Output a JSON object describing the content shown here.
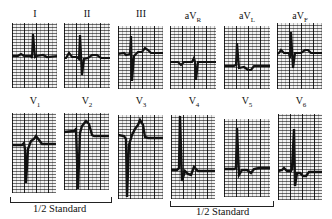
{
  "figure": {
    "type": "12-lead electrocardiogram strips",
    "rows": [
      {
        "leads": [
          {
            "label": "I",
            "sub": ""
          },
          {
            "label": "II",
            "sub": ""
          },
          {
            "label": "III",
            "sub": ""
          },
          {
            "label": "aV",
            "sub": "R"
          },
          {
            "label": "aV",
            "sub": "L"
          },
          {
            "label": "aV",
            "sub": "F"
          }
        ]
      },
      {
        "leads": [
          {
            "label": "V",
            "sub": "1"
          },
          {
            "label": "V",
            "sub": "2"
          },
          {
            "label": "V",
            "sub": "3"
          },
          {
            "label": "V",
            "sub": "4"
          },
          {
            "label": "V",
            "sub": "5"
          },
          {
            "label": "V",
            "sub": "6"
          }
        ]
      }
    ],
    "annotations": [
      {
        "text": "1/2 Standard",
        "spans": [
          "V1",
          "V2"
        ]
      },
      {
        "text": "1/2 Standard",
        "spans": [
          "V4",
          "V5"
        ]
      }
    ],
    "colors": {
      "trace": "#111111",
      "grid": "#333333",
      "paper": "#f2f2f2"
    }
  }
}
